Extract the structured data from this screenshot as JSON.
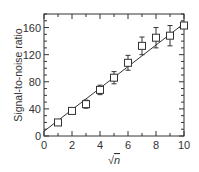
{
  "chart_data": {
    "type": "scatter",
    "title": "",
    "xlabel": "√n",
    "ylabel": "Signal-to-noise ratio",
    "xlim": [
      0,
      10
    ],
    "ylim": [
      0,
      180
    ],
    "xticks": [
      0,
      2,
      4,
      6,
      8,
      10
    ],
    "yticks": [
      0,
      40,
      80,
      120,
      160
    ],
    "grid": false,
    "legend": null,
    "series": [
      {
        "name": "measured",
        "marker": "open-square",
        "x": [
          1,
          2,
          3,
          4,
          5,
          6,
          7,
          8,
          9,
          10
        ],
        "y": [
          20,
          37,
          47,
          68,
          86,
          108,
          133,
          145,
          148,
          163
        ],
        "yerr": [
          2,
          3,
          6,
          7,
          9,
          11,
          13,
          15,
          15,
          4
        ]
      },
      {
        "name": "linear fit",
        "style": "line",
        "x": [
          0,
          10
        ],
        "y": [
          7,
          166
        ]
      }
    ]
  },
  "axis": {
    "xlabel": "√n",
    "ylabel": "Signal-to-noise ratio"
  }
}
